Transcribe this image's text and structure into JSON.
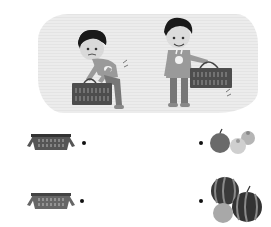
{
  "scene": {
    "description": "Two boys carrying shopping baskets: one struggling with a heavy basket, one carrying a light basket easily",
    "figures": [
      {
        "id": "boy-heavy",
        "label": "boy struggling with heavy basket"
      },
      {
        "id": "boy-light",
        "label": "boy smiling with light basket"
      }
    ]
  },
  "matching": {
    "left_items": [
      {
        "id": "basket-1",
        "label": "basket"
      },
      {
        "id": "basket-2",
        "label": "basket"
      }
    ],
    "right_items": [
      {
        "id": "fruits-small",
        "label": "apple and oranges"
      },
      {
        "id": "fruits-large",
        "label": "watermelons and melon"
      }
    ]
  },
  "colors": {
    "panel_bg": "#e8e8e8",
    "basket": "#555555",
    "dot": "#111111"
  }
}
